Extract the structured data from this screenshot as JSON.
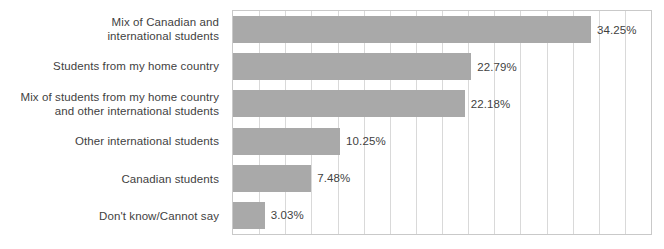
{
  "chart_data": {
    "type": "bar",
    "orientation": "horizontal",
    "title": "",
    "subtitle": "",
    "xlabel": "",
    "ylabel": "",
    "xlim": [
      0,
      40
    ],
    "grid": true,
    "grid_axis": "x",
    "grid_interval": 2.5,
    "legend": false,
    "value_labels": true,
    "value_label_suffix": "%",
    "bar_color": "#a9a9a9",
    "text_color": "#3f3f3f",
    "plot_border_color": "#c9c9c9",
    "gridline_color": "#d9d9d9",
    "categories": [
      "Mix of Canadian and\ninternational students",
      "Students from my home country",
      "Mix of students from my home country\nand other international students",
      "Other international students",
      "Canadian students",
      "Don't know/Cannot say"
    ],
    "values": [
      34.25,
      22.79,
      22.18,
      10.25,
      7.48,
      3.03
    ],
    "value_labels_text": [
      "34.25%",
      "22.79%",
      "22.18%",
      "10.25%",
      "7.48%",
      "3.03%"
    ],
    "xtick_labels": [],
    "ytick_labels": [
      "Mix of Canadian and\ninternational students",
      "Students from my home country",
      "Mix of students from my home country\nand other international students",
      "Other international students",
      "Canadian students",
      "Don't know/Cannot say"
    ]
  }
}
